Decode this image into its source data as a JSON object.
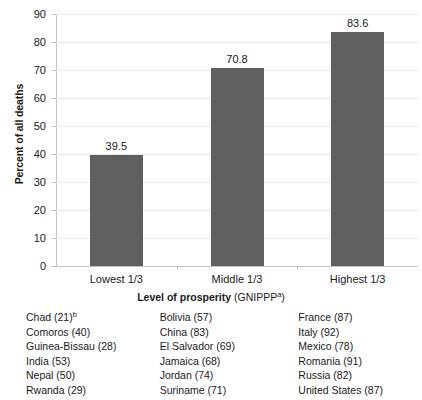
{
  "chart_data": {
    "type": "bar",
    "title": "",
    "categories": [
      "Lowest 1/3",
      "Middle 1/3",
      "Highest 1/3"
    ],
    "values": [
      39.5,
      70.8,
      83.6
    ],
    "value_labels": [
      "39.5",
      "70.8",
      "83.6"
    ],
    "xlabel": "Level of prosperity (GNIPPP)",
    "xlabel_main": "Level of prosperity",
    "xlabel_paren": "(GNIPPP",
    "xlabel_paren_sup": "a",
    "xlabel_paren_close": ")",
    "ylabel": "Percent of all deaths",
    "ylim": [
      0,
      90
    ],
    "ytick_step": 10,
    "yticks": [
      "90",
      "80",
      "70",
      "60",
      "50",
      "40",
      "30",
      "20",
      "10",
      "0"
    ],
    "grid": true,
    "legend": "none",
    "bar_color": "#5f5f5f",
    "gridline_color": "#e9e9e9",
    "axis_color": "#c3c3c3"
  },
  "country_table": {
    "columns": [
      {
        "group": "Lowest 1/3",
        "items": [
          {
            "text": "Chad (21)",
            "sup": "b"
          },
          {
            "text": "Comoros (40)",
            "sup": ""
          },
          {
            "text": "Guinea-Bissau (28)",
            "sup": ""
          },
          {
            "text": "India (53)",
            "sup": ""
          },
          {
            "text": "Nepal (50)",
            "sup": ""
          },
          {
            "text": "Rwanda (29)",
            "sup": ""
          }
        ]
      },
      {
        "group": "Middle 1/3",
        "items": [
          {
            "text": "Bolivia (57)",
            "sup": ""
          },
          {
            "text": "China (83)",
            "sup": ""
          },
          {
            "text": "El Salvador (69)",
            "sup": ""
          },
          {
            "text": "Jamaica (68)",
            "sup": ""
          },
          {
            "text": "Jordan (74)",
            "sup": ""
          },
          {
            "text": "Suriname (71)",
            "sup": ""
          }
        ]
      },
      {
        "group": "Highest 1/3",
        "items": [
          {
            "text": "France (87)",
            "sup": ""
          },
          {
            "text": "Italy (92)",
            "sup": ""
          },
          {
            "text": "Mexico (78)",
            "sup": ""
          },
          {
            "text": "Romania (91)",
            "sup": ""
          },
          {
            "text": "Russia (82)",
            "sup": ""
          },
          {
            "text": "United States (87)",
            "sup": ""
          }
        ]
      }
    ]
  }
}
